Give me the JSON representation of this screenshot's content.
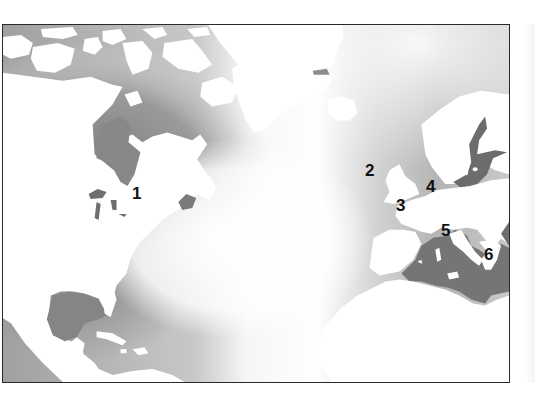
{
  "map": {
    "type": "regional map",
    "region": "North Atlantic Ocean",
    "style": "grayscale; white land, gray ocean gradient darkening toward coastlines",
    "colors": {
      "land": "#ffffff",
      "ocean_deep_coastal": "#7e7e7e",
      "ocean_mid": "#a8a8a8",
      "ocean_open": "#ffffff",
      "inland_sea": "#707070",
      "frame": "#2a2a2a",
      "label_text": "#111111"
    },
    "labels": [
      {
        "id": "1",
        "text": "1",
        "location": "eastern North America (Great Lakes region)"
      },
      {
        "id": "2",
        "text": "2",
        "location": "west of Britain / Ireland"
      },
      {
        "id": "3",
        "text": "3",
        "location": "Bay of Biscay / western France"
      },
      {
        "id": "4",
        "text": "4",
        "location": "central Europe"
      },
      {
        "id": "5",
        "text": "5",
        "location": "Italy / central Mediterranean"
      },
      {
        "id": "6",
        "text": "6",
        "location": "Greece / eastern Mediterranean"
      }
    ],
    "features": [
      "North America",
      "Greenland",
      "Iceland",
      "British Isles",
      "Scandinavia",
      "Baltic Sea",
      "Mediterranean Sea",
      "Gulf of Mexico",
      "Caribbean Sea",
      "North Africa"
    ]
  }
}
